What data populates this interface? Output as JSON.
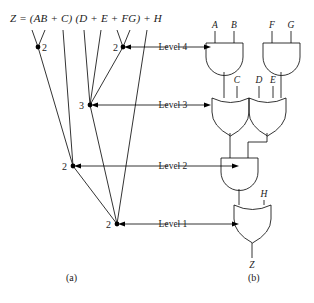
{
  "figure": {
    "equation": "Z = (AB + C) (D + E + FG) + H",
    "equation_parts": {
      "lhs": "Z",
      "eq": "=",
      "term1": "(AB + C)",
      "term2": "(D + E + FG)",
      "plus": "+",
      "term3": "H"
    },
    "caption_a": "(a)",
    "caption_b": "(b)"
  },
  "tree": {
    "leaves": [
      {
        "label": "A",
        "x": 30,
        "y": 30
      },
      {
        "label": "B",
        "x": 44,
        "y": 30
      },
      {
        "label": "C",
        "x": 62,
        "y": 30
      },
      {
        "label": "D",
        "x": 82,
        "y": 30
      },
      {
        "label": "E",
        "x": 100,
        "y": 30
      },
      {
        "label": "F",
        "x": 116,
        "y": 30
      },
      {
        "label": "G",
        "x": 128,
        "y": 30
      },
      {
        "label": "H",
        "x": 146,
        "y": 30
      }
    ],
    "nodes": [
      {
        "id": "n-and-ab",
        "label": "2",
        "x": 38,
        "y": 47,
        "level": 4
      },
      {
        "id": "n-and-fg",
        "label": "2",
        "x": 123,
        "y": 47,
        "level": 4
      },
      {
        "id": "n-or-defg",
        "label": "3",
        "x": 90,
        "y": 105,
        "level": 3
      },
      {
        "id": "n-or-abc",
        "label": "2",
        "x": 73,
        "y": 166,
        "level": 3
      },
      {
        "id": "n-and-top",
        "label": "2",
        "x": 117,
        "y": 224,
        "level": 1
      }
    ],
    "levels": [
      {
        "label": "Level 4",
        "y": 47
      },
      {
        "label": "Level 3",
        "y": 105
      },
      {
        "label": "Level 2",
        "y": 166
      },
      {
        "label": "Level 1",
        "y": 224
      }
    ]
  },
  "circuit": {
    "gates": [
      {
        "id": "gate-and-ab",
        "type": "AND",
        "level": 4,
        "inputs": [
          "A",
          "B"
        ]
      },
      {
        "id": "gate-and-fg",
        "type": "AND",
        "level": 4,
        "inputs": [
          "F",
          "G"
        ]
      },
      {
        "id": "gate-or-abc",
        "type": "OR",
        "level": 3,
        "inputs": [
          "C"
        ]
      },
      {
        "id": "gate-or-defg",
        "type": "OR",
        "level": 3,
        "inputs": [
          "D",
          "E"
        ]
      },
      {
        "id": "gate-and-main",
        "type": "AND",
        "level": 2,
        "inputs": []
      },
      {
        "id": "gate-or-out",
        "type": "OR",
        "level": 1,
        "inputs": [
          "H"
        ]
      }
    ],
    "input_labels": [
      {
        "label": "A",
        "x": 213,
        "y": 24
      },
      {
        "label": "B",
        "x": 233,
        "y": 24
      },
      {
        "label": "F",
        "x": 270,
        "y": 24
      },
      {
        "label": "G",
        "x": 289,
        "y": 24
      },
      {
        "label": "C",
        "x": 235,
        "y": 79
      },
      {
        "label": "D",
        "x": 258,
        "y": 79
      },
      {
        "label": "E",
        "x": 272,
        "y": 79
      },
      {
        "label": "H",
        "x": 263,
        "y": 193
      }
    ],
    "output_label": "Z"
  },
  "colors": {
    "line": "#000000",
    "text": "#1a1a1a",
    "background": "#ffffff"
  }
}
